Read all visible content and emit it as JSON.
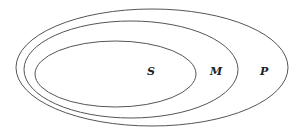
{
  "diagram": {
    "type": "nested-venn",
    "stroke_color": "#555555",
    "background": "#ffffff",
    "sets": [
      {
        "id": "P",
        "label": "P",
        "cx": 152,
        "cy": 67.5,
        "rx": 136,
        "ry": 58.5,
        "label_x": 264,
        "label_y": 75
      },
      {
        "id": "M",
        "label": "M",
        "cx": 131,
        "cy": 69.5,
        "rx": 107,
        "ry": 48.5,
        "label_x": 215,
        "label_y": 75
      },
      {
        "id": "S",
        "label": "S",
        "cx": 115.5,
        "cy": 74,
        "rx": 80.5,
        "ry": 33,
        "label_x": 150,
        "label_y": 75
      }
    ]
  }
}
